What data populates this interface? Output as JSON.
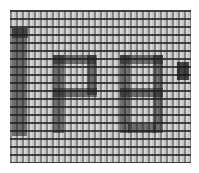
{
  "canvas": {
    "description": "Zoomed pixel grid showing large glyphs",
    "glyphs": [
      "I",
      "P",
      "8",
      "'"
    ],
    "text": "IP8'",
    "colors": {
      "grid_background": "#c4c4c4",
      "grid_lines": "#282828",
      "glyph": "#1e1e1e"
    }
  }
}
